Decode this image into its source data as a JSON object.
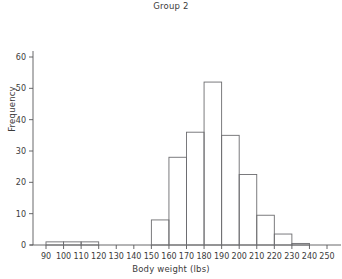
{
  "chart_data": {
    "type": "bar",
    "title": "Group 2",
    "xlabel": "Body weight (lbs)",
    "ylabel": "Frequency",
    "bin_width": 10,
    "bin_edges": [
      90,
      100,
      110,
      120,
      130,
      140,
      150,
      160,
      170,
      180,
      190,
      200,
      210,
      220,
      230,
      240,
      250
    ],
    "categories": [
      "90-100",
      "100-110",
      "110-120",
      "120-130",
      "130-140",
      "140-150",
      "150-160",
      "160-170",
      "170-180",
      "180-190",
      "190-200",
      "200-210",
      "210-220",
      "220-230",
      "230-240",
      "240-250"
    ],
    "values": [
      1,
      1,
      1,
      0,
      0,
      0,
      8,
      28,
      36,
      52,
      35,
      22.5,
      9.5,
      3.5,
      0.5,
      0
    ],
    "xlim": [
      85,
      255
    ],
    "ylim": [
      0,
      62
    ],
    "xticks": [
      90,
      100,
      110,
      120,
      130,
      140,
      150,
      160,
      170,
      180,
      190,
      200,
      210,
      220,
      230,
      240,
      250
    ],
    "yticks": [
      0,
      10,
      20,
      30,
      40,
      50,
      60
    ],
    "xtick_labels": [
      "90",
      "100",
      "110",
      "120",
      "130",
      "140",
      "150",
      "160",
      "170",
      "180",
      "190",
      "200",
      "210",
      "220",
      "230",
      "240",
      "250"
    ],
    "ytick_labels": [
      "0",
      "10",
      "20",
      "30",
      "40",
      "50",
      "60"
    ],
    "grid": false,
    "legend": null,
    "bar_fill": "#ffffff",
    "bar_stroke": "#6d6d70",
    "axis_color": "#58585a",
    "text_color": "#3b3b3b"
  }
}
